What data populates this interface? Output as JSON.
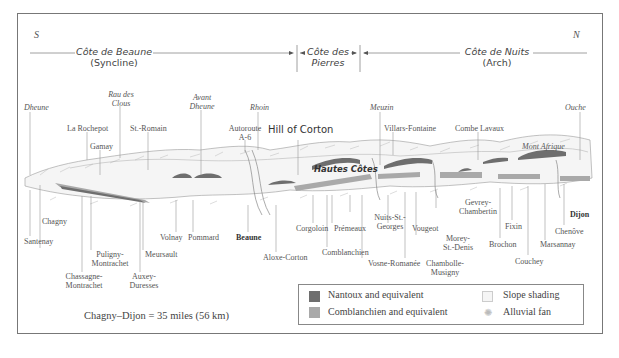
{
  "compass": {
    "south": "S",
    "north": "N"
  },
  "regions": [
    {
      "name": "Côte de Beaune",
      "sub": "(Syncline)"
    },
    {
      "name": "Côte des",
      "sub": "Pierres"
    },
    {
      "name": "Côte de Nuits",
      "sub": "(Arch)"
    }
  ],
  "rivers": {
    "dheune": "Dheune",
    "rau_des_clous_1": "Rau des",
    "rau_des_clous_2": "Clous",
    "avant_dheune_1": "Avant",
    "avant_dheune_2": "Dheune",
    "rhoin": "Rhoin",
    "meuzin": "Meuzin",
    "ouche": "Ouche"
  },
  "upper_labels": {
    "la_rochepot": "La Rochepot",
    "gamay": "Gamay",
    "st_romain": "St.-Romain",
    "autoroute_1": "Autoroute",
    "autoroute_2": "A-6",
    "hill_of_corton": "Hill of Corton",
    "hautes_cotes": "Hautes Côtes",
    "villars_fontaine": "Villars-Fontaine",
    "combe_lavaux": "Combe Lavaux",
    "mont_afrique": "Mont Afrique"
  },
  "villages": {
    "chagny": "Chagny",
    "santenay": "Santenay",
    "puligny_1": "Puligny-",
    "puligny_2": "Montrachet",
    "chassagne_1": "Chassagne-",
    "chassagne_2": "Montrachet",
    "meursault": "Meursault",
    "auxey_1": "Auxey-",
    "auxey_2": "Duresses",
    "volnay": "Volnay",
    "pommard": "Pommard",
    "beaune": "Beaune",
    "aloxe_corton": "Aloxe-Corton",
    "corgoloin": "Corgoloin",
    "premeaux": "Prémeaux",
    "comblanchien": "Comblanchien",
    "nuits_1": "Nuits-St.-",
    "nuits_2": "Georges",
    "vosne": "Vosne-Romanée",
    "vougeot": "Vougeot",
    "chambolle_1": "Chambolle-",
    "chambolle_2": "Musigny",
    "morey_1": "Morey-",
    "morey_2": "St.-Denis",
    "gevrey_1": "Gevrey-",
    "gevrey_2": "Chambertin",
    "brochon": "Brochon",
    "fixin": "Fixin",
    "couchey": "Couchey",
    "marsannay": "Marsannay",
    "chenove": "Chenôve",
    "dijon": "Dijon"
  },
  "scale_note": "Chagny–Dijon = 35 miles (56 km)",
  "legend": {
    "items": [
      {
        "label": "Nantoux and equivalent",
        "color": "#6e6e6e"
      },
      {
        "label": "Comblanchien and equivalent",
        "color": "#a9a9a9"
      },
      {
        "label": "Slope shading",
        "color": "#f2f2f2"
      },
      {
        "label": "Alluvial fan",
        "color": "#d0d0d0"
      }
    ]
  },
  "colors": {
    "nantoux": "#6e6e6e",
    "comblanchien": "#a9a9a9",
    "line": "#999999"
  }
}
